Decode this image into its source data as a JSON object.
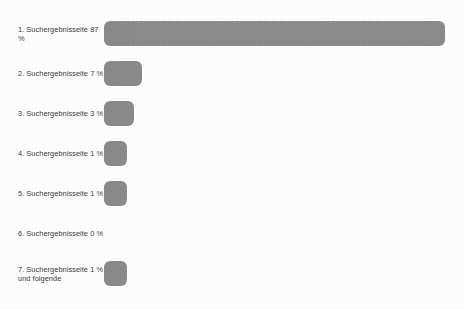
{
  "chart_data": {
    "type": "bar",
    "title": "",
    "subtitle": "",
    "xlabel": "",
    "ylabel": "",
    "grid": false,
    "legend": null,
    "orientation": "horizontal",
    "unit_symbol": "%",
    "note": "Pictogram/unit bar chart: each bar is drawn as a row of overlapping rounded squares proportional to the percentage value.",
    "categories": [
      "1. Suchergebnisseite",
      "2. Suchergebnisseite",
      "3. Suchergebnisseite",
      "4. Suchergebnisseite",
      "5. Suchergebnisseite",
      "6. Suchergebnisseite",
      "7. Suchergebnisseite und folgende"
    ],
    "values": [
      87,
      7,
      3,
      1,
      1,
      0,
      1
    ],
    "xlim": [
      0,
      100
    ],
    "rows": [
      {
        "index": "1.",
        "label": "1. Suchergebnisseite 87 %",
        "label_line1": "1. Suchergebnisseite 87 %",
        "label_line2": "",
        "value": 87,
        "value_text": "87 %",
        "units": 44,
        "bar_width_px": 326
      },
      {
        "index": "2.",
        "label": "2. Suchergebnisseite 7 %",
        "label_line1": "2. Suchergebnisseite 7 %",
        "label_line2": "",
        "value": 7,
        "value_text": "7 %",
        "units": 3,
        "bar_width_px": 38
      },
      {
        "index": "3.",
        "label": "3. Suchergebnisseite 3 %",
        "label_line1": "3. Suchergebnisseite 3 %",
        "label_line2": "",
        "value": 3,
        "value_text": "3 %",
        "units": 2,
        "bar_width_px": 31
      },
      {
        "index": "4.",
        "label": "4. Suchergebnisseite 1 %",
        "label_line1": "4. Suchergebnisseite 1 %",
        "label_line2": "",
        "value": 1,
        "value_text": "1 %",
        "units": 1,
        "bar_width_px": 23
      },
      {
        "index": "5.",
        "label": "5. Suchergebnisseite 1 %",
        "label_line1": "5. Suchergebnisseite 1 %",
        "label_line2": "",
        "value": 1,
        "value_text": "1 %",
        "units": 1,
        "bar_width_px": 23
      },
      {
        "index": "6.",
        "label": "6. Suchergebnisseite 0 %",
        "label_line1": "6. Suchergebnisseite 0 %",
        "label_line2": "",
        "value": 0,
        "value_text": "0 %",
        "units": 0,
        "bar_width_px": 0
      },
      {
        "index": "7.",
        "label": "7. Suchergebnisseite 1 %\nund folgende",
        "label_line1": "7. Suchergebnisseite 1 %",
        "label_line2": "und folgende",
        "value": 1,
        "value_text": "1 %",
        "units": 1,
        "bar_width_px": 23
      }
    ]
  },
  "colors": {
    "bar": "#8a8a8a",
    "text": "#3b3b3b",
    "background": "#fdfdfd",
    "cut_text": "#c9c9c9"
  },
  "footer": {
    "cut_off_caption": ""
  }
}
